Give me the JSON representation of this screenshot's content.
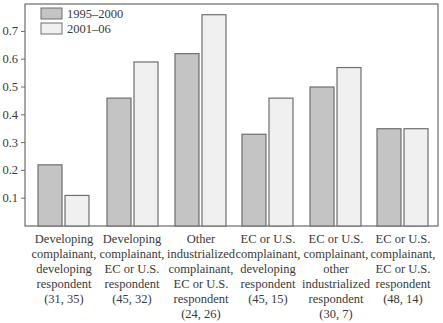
{
  "chart_data": {
    "type": "bar",
    "title": "",
    "xlabel": "",
    "ylabel": "",
    "ylim": [
      0,
      0.8
    ],
    "yticks": [
      0.1,
      0.2,
      0.3,
      0.4,
      0.5,
      0.6,
      0.7
    ],
    "ytick_labels": [
      "0.1",
      "0.2",
      "0.3",
      "0.4",
      "0.5",
      "0.6",
      "0.7"
    ],
    "grid": false,
    "legend_position": "upper left",
    "categories": [
      "Developing complainant, developing respondent (31, 35)",
      "Developing complainant, EC or U.S. respondent (45, 32)",
      "Other industrialized complainant, EC or U.S. respondent (24, 26)",
      "EC or U.S. complainant, developing respondent (45, 15)",
      "EC or U.S. complainant, other industrialized respondent (30, 7)",
      "EC or U.S. complainant, EC or U.S. respondent (48, 14)"
    ],
    "category_lines": [
      [
        "Developing",
        "complainant,",
        "developing",
        "respondent",
        "(31, 35)"
      ],
      [
        "Developing",
        "complainant,",
        "EC or U.S.",
        "respondent",
        "(45, 32)"
      ],
      [
        "Other",
        "industrialized",
        "complainant,",
        "EC or U.S.",
        "respondent",
        "(24, 26)"
      ],
      [
        "EC or U.S.",
        "complainant,",
        "developing",
        "respondent",
        "(45, 15)"
      ],
      [
        "EC or U.S.",
        "complainant,",
        "other",
        "industrialized",
        "respondent",
        "(30, 7)"
      ],
      [
        "EC or U.S.",
        "complainant,",
        "EC or U.S.",
        "respondent",
        "(48, 14)"
      ]
    ],
    "series": [
      {
        "name": "1995–2000",
        "color": "#c4c4c4",
        "values": [
          0.22,
          0.46,
          0.62,
          0.33,
          0.5,
          0.35
        ]
      },
      {
        "name": "2001–06",
        "color": "#f0f0f0",
        "values": [
          0.11,
          0.59,
          0.76,
          0.46,
          0.57,
          0.35
        ]
      }
    ]
  },
  "colors": {
    "axis": "#6a6a6a",
    "bar_edge": "#6f6f6f",
    "text": "#3a3a3a"
  }
}
